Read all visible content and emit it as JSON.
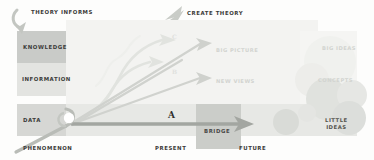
{
  "diagram": {
    "vertical_axis": {
      "name": "knowledge-ladder",
      "levels": [
        {
          "label": "KNOWLEDGE",
          "fill": "#c9cbc8"
        },
        {
          "label": "INFORMATION",
          "fill": "#e3e4e1"
        },
        {
          "label": "DATA",
          "fill": "#d6d7d4"
        },
        {
          "label": "PHENOMENON",
          "fill": "transparent"
        }
      ]
    },
    "horizontal_axis": {
      "name": "time-axis",
      "ticks": [
        {
          "label": "PRESENT"
        },
        {
          "label": "FUTURE"
        }
      ]
    },
    "annotations": {
      "theory_informs": "THEORY INFORMS",
      "create_theory": "CREATE THEORY",
      "bridge": "BRIDGE",
      "marker_a": "A",
      "marker_b": "B",
      "marker_c": "C"
    },
    "faint_labels": {
      "big_picture": "BIG PICTURE",
      "new_views": "NEW VIEWS",
      "big_ideas": "BIG IDEAS",
      "concepts": "CONCEPTS"
    },
    "little_ideas": {
      "line1": "LITTLE",
      "line2": "IDEAS"
    },
    "icons": {
      "theory_informs_arrow": "curved-down-arrow-icon",
      "create_theory_arrow": "up-right-arrow-icon",
      "present_future_arrow": "right-arrow-icon",
      "fan_arrows": "fan-arrow-icon"
    },
    "colors": {
      "ink": "#3c3c3a",
      "arrow_dark": "#9b9e99",
      "arrow_light": "#dcdedb",
      "band_knowledge": "#c9cbc8",
      "band_information": "#e3e4e1",
      "band_data": "#d6d7d4",
      "band_bridge": "#cbcdc9",
      "wash": "#f3f3f1",
      "circle": "#e2e4e0"
    }
  }
}
